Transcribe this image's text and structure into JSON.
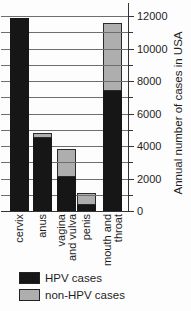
{
  "chart_data": {
    "type": "bar",
    "stacked": true,
    "title": "",
    "categories": [
      "cervix",
      "anus",
      "vagina\nand vulva",
      "penis",
      "mouth and\nthroat"
    ],
    "series": [
      {
        "name": "HPV cases",
        "color": "#161616",
        "values": [
          11900,
          4500,
          2100,
          400,
          7400
        ]
      },
      {
        "name": "non-HPV cases",
        "color": "#aeaeae",
        "values": [
          0,
          300,
          1700,
          700,
          4200
        ]
      }
    ],
    "xlabel": "",
    "ylabel": "Annual number of cases in USA",
    "ylim": [
      0,
      12000
    ],
    "gridline_step": 1000,
    "ytick_minor_step": 1000,
    "ytick_label_step": 2000,
    "grid": true,
    "axis_side": "right",
    "legend_position": "bottom-left"
  }
}
